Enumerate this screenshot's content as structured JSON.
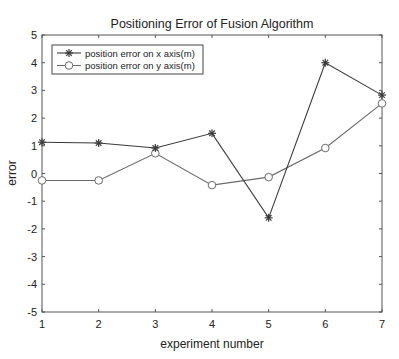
{
  "chart_data": {
    "type": "line",
    "title": "Positioning Error of Fusion Algorithm",
    "xlabel": "experiment number",
    "ylabel": "error",
    "x": [
      1,
      2,
      3,
      4,
      5,
      6,
      7
    ],
    "xlim": [
      1,
      7
    ],
    "ylim": [
      -5,
      5
    ],
    "xticks": [
      1,
      2,
      3,
      4,
      5,
      6,
      7
    ],
    "yticks": [
      5,
      4,
      3,
      2,
      1,
      0,
      -1,
      -2,
      -3,
      -4,
      -5
    ],
    "grid": false,
    "legend_position": "upper left",
    "series": [
      {
        "name": "position error on x axis(m)",
        "marker": "asterisk",
        "color": "#3a3a3a",
        "values": [
          1.13,
          1.1,
          0.92,
          1.45,
          -1.6,
          4.0,
          2.83
        ]
      },
      {
        "name": "position error on y axis(m)",
        "marker": "circle",
        "color": "#6a6a6a",
        "values": [
          -0.25,
          -0.25,
          0.73,
          -0.42,
          -0.13,
          0.92,
          2.53
        ]
      }
    ]
  },
  "caption": "Fig. 3. Positioning error of the fusion algorithm"
}
